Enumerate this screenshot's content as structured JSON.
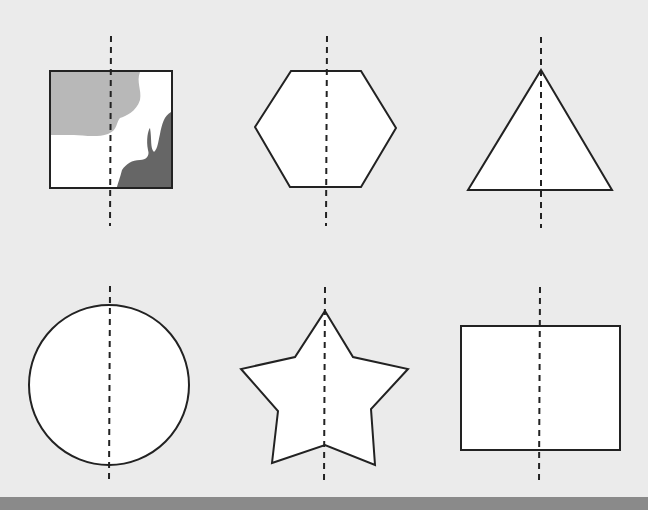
{
  "colors": {
    "background": "#ebebeb",
    "shape_fill": "#ffffff",
    "stroke": "#222222",
    "light_shadow": "#b8b8b8",
    "dark_shadow": "#666666",
    "bottom_bar": "#8a8a8a"
  },
  "shapes": [
    {
      "name": "square-with-silhouettes",
      "type": "square",
      "axis_x": 110,
      "axis_y": [
        36,
        226
      ]
    },
    {
      "name": "hexagon",
      "type": "hexagon",
      "axis_x": 326,
      "axis_y": [
        36,
        226
      ]
    },
    {
      "name": "triangle",
      "type": "triangle",
      "axis_x": 541,
      "axis_y": [
        36,
        226
      ]
    },
    {
      "name": "circle",
      "type": "circle",
      "axis_x": 110,
      "axis_y": [
        286,
        480
      ]
    },
    {
      "name": "star",
      "type": "star",
      "axis_x": 325,
      "axis_y": [
        286,
        480
      ]
    },
    {
      "name": "rectangle",
      "type": "rectangle",
      "axis_x": 540,
      "axis_y": [
        286,
        480
      ]
    }
  ]
}
